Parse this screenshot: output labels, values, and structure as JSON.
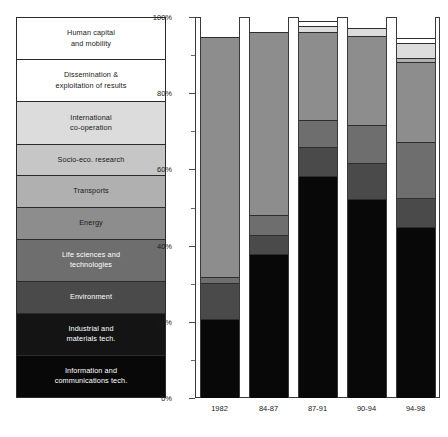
{
  "legend": {
    "items": [
      {
        "label": "Human capital\nand mobility",
        "color": "#ffffff",
        "text_color": "#1a1a1a"
      },
      {
        "label": "Dissemination &\nexploitation of results",
        "color": "#ffffff",
        "text_color": "#1a1a1a"
      },
      {
        "label": "International\nco-operation",
        "color": "#dcdcdc",
        "text_color": "#1a1a1a"
      },
      {
        "label": "Socio-eco. research",
        "color": "#c6c6c6",
        "text_color": "#1a1a1a"
      },
      {
        "label": "Transports",
        "color": "#b0b0b0",
        "text_color": "#1a1a1a"
      },
      {
        "label": "Energy",
        "color": "#8d8d8d",
        "text_color": "#1a1a1a"
      },
      {
        "label": "Life sciences and\ntechnologies",
        "color": "#6e6e6e",
        "text_color": "#ffffff"
      },
      {
        "label": "Environment",
        "color": "#4a4a4a",
        "text_color": "#ffffff"
      },
      {
        "label": "Industrial and\nmaterials tech.",
        "color": "#141414",
        "text_color": "#ffffff"
      },
      {
        "label": "Information and\ncommunications tech.",
        "color": "#080808",
        "text_color": "#ffffff"
      }
    ]
  },
  "chart_data": {
    "type": "bar",
    "stacked": true,
    "normalized": true,
    "title": "",
    "xlabel": "",
    "ylabel": "",
    "ylim": [
      0,
      100
    ],
    "ytick_labels": [
      "0%",
      "20%",
      "40%",
      "60%",
      "80%",
      "100%"
    ],
    "ytick_values": [
      0,
      20,
      40,
      60,
      80,
      100
    ],
    "grid": false,
    "legend_position": "left",
    "categories": [
      "1982",
      "84-87",
      "87-91",
      "90-94",
      "94-98"
    ],
    "series": [
      {
        "name": "Information and communications tech.",
        "color": "#080808",
        "values": [
          20.5,
          37.5,
          58.0,
          52.0,
          44.5
        ]
      },
      {
        "name": "Industrial and materials tech.",
        "color": "#141414",
        "values": [
          0.0,
          0.0,
          0.0,
          0.0,
          0.0
        ]
      },
      {
        "name": "Environment",
        "color": "#4a4a4a",
        "values": [
          9.5,
          5.0,
          7.5,
          9.5,
          7.8
        ]
      },
      {
        "name": "Life sciences and technologies",
        "color": "#6e6e6e",
        "values": [
          1.6,
          5.3,
          7.3,
          9.8,
          14.5
        ]
      },
      {
        "name": "Energy",
        "color": "#8d8d8d",
        "values": [
          63.0,
          48.0,
          23.0,
          23.5,
          21.0
        ]
      },
      {
        "name": "Transports",
        "color": "#b0b0b0",
        "values": [
          0.0,
          0.0,
          0.0,
          0.0,
          1.3
        ]
      },
      {
        "name": "Socio-eco. research",
        "color": "#c6c6c6",
        "values": [
          0.0,
          0.0,
          0.0,
          0.0,
          0.0
        ]
      },
      {
        "name": "International co-operation",
        "color": "#dcdcdc",
        "values": [
          0.0,
          0.0,
          1.6,
          2.1,
          3.7
        ]
      },
      {
        "name": "Dissemination & exploitation of results",
        "color": "#ffffff",
        "values": [
          0.0,
          0.0,
          1.3,
          0.0,
          1.3
        ]
      },
      {
        "name": "Human capital and mobility",
        "color": "#ffffff",
        "values": [
          5.4,
          4.2,
          1.3,
          3.1,
          5.9
        ]
      }
    ]
  }
}
